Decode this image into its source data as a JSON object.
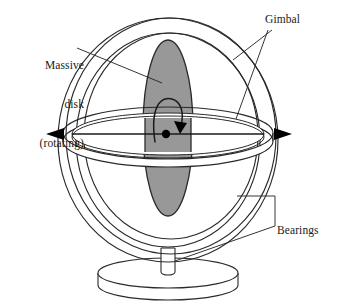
{
  "figure": {
    "background_color": "#ffffff",
    "stroke_color": "#1a1a1a",
    "disk_fill_color": "#989898"
  },
  "labels": {
    "massive_disk": {
      "line1": "Massive",
      "line2": "disk",
      "line3": "(rotating)"
    },
    "gimbal": "Gimbal",
    "bearings": "Bearings"
  },
  "parts": {
    "outer_gimbal_ring": "outer-gimbal-ring",
    "inner_gimbal_ring": "inner-gimbal-ring",
    "horizontal_gimbal_ring": "horizontal-gimbal-ring",
    "massive_disk": "massive-disk",
    "spin_axis": "spin-axis",
    "spin_arrow": "spin-direction-arrow",
    "center_hub": "center-hub",
    "support_stem": "support-stem",
    "base": "base-platform"
  },
  "annotations": {
    "left_axis_arrowhead": "left-axis-arrowhead",
    "right_axis_arrowhead": "right-axis-arrowhead",
    "spin_arrowhead": "spin-arrowhead"
  }
}
